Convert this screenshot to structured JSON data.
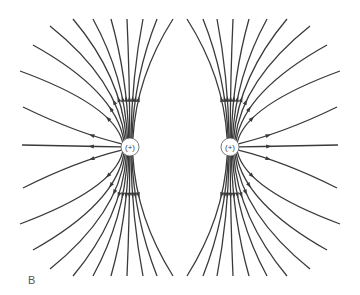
{
  "figure": {
    "label": "B",
    "charges": [
      {
        "id": "left",
        "sign": "+",
        "label": "(+)",
        "x": 130,
        "y": 147
      },
      {
        "id": "right",
        "sign": "+",
        "label": "(+)",
        "x": 230,
        "y": 147
      }
    ],
    "line_color": "#3a3a3a",
    "charge_radius": 9,
    "left_endpoints_top": [
      [
        22,
        145
      ],
      [
        23,
        107
      ],
      [
        20,
        71
      ],
      [
        33,
        45
      ],
      [
        50,
        26
      ],
      [
        73,
        19
      ],
      [
        93,
        19
      ],
      [
        111,
        19
      ],
      [
        127,
        19
      ],
      [
        143,
        19
      ],
      [
        157,
        19
      ],
      [
        173,
        19
      ]
    ]
  }
}
